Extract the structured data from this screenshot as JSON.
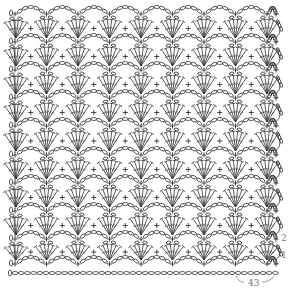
{
  "diagram": {
    "type": "crochet-stitch-chart",
    "pattern": "fan-and-arch lace",
    "line_color": "#333333",
    "background": "#ffffff",
    "label_color": "#777777",
    "repeat_width_px": 31.5,
    "first_repeat_x": 15,
    "repeats_per_row": 9,
    "arch_row_y": [
      14,
      42,
      70,
      98,
      126,
      155,
      183,
      211,
      239,
      264
    ],
    "foundation_y": 273,
    "foundation_start_x": 10,
    "foundation_end_x": 276,
    "stitch_symbols": {
      "chain": "oval",
      "single_crochet": "plus",
      "double_crochet": "T-bar-with-slash",
      "turning_chain": "0"
    },
    "row_labels": [
      {
        "text": "2",
        "x": 281,
        "y": 234
      },
      {
        "text": "1",
        "x": 281,
        "y": 251
      }
    ],
    "foundation_count": {
      "text": "43",
      "x": 248,
      "y": 279
    }
  }
}
